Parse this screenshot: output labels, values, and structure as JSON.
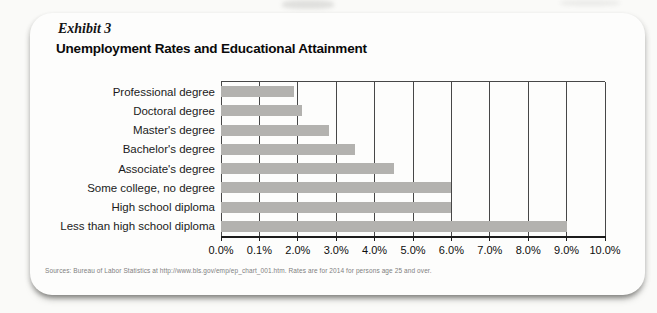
{
  "page": {
    "exhibit_label": "Exhibit 3",
    "title": "Unemployment Rates and Educational Attainment",
    "source": "Sources: Bureau of Labor Statistics at http://www.bls.gov/emp/ep_chart_001.htm. Rates are for 2014 for persons age 25 and over."
  },
  "chart_data": {
    "type": "bar",
    "orientation": "horizontal",
    "title": "Unemployment Rates and Educational Attainment",
    "categories": [
      "Professional degree",
      "Doctoral degree",
      "Master's degree",
      "Bachelor's degree",
      "Associate's degree",
      "Some college, no degree",
      "High school diploma",
      "Less than high school diploma"
    ],
    "values": [
      1.9,
      2.1,
      2.8,
      3.5,
      4.5,
      6.0,
      6.0,
      9.0
    ],
    "unit": "%",
    "xlim": [
      0,
      10
    ],
    "x_tick_labels": [
      "0.0%",
      "0.1%",
      "2.0%",
      "3.0%",
      "4.0%",
      "5.0%",
      "6.0%",
      "7.0%",
      "8.0%",
      "9.0%",
      "10.0%"
    ],
    "grid": "vertical gridlines at every tick",
    "legend": "none"
  },
  "colors": {
    "bar": "#b3b2af",
    "gridline": "#474747",
    "axis": "#1c1c1c",
    "card_background": "#fdfdfc"
  }
}
